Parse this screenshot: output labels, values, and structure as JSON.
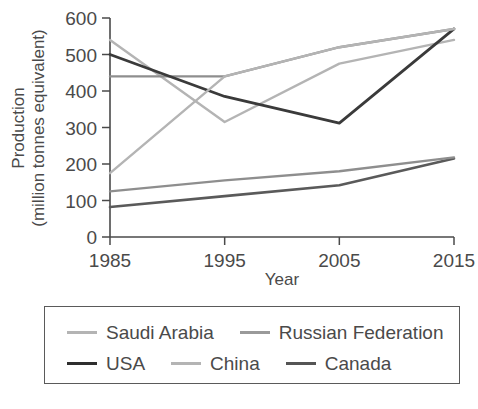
{
  "chart_data": {
    "type": "line",
    "title": "",
    "xlabel": "Year",
    "ylabel": "Production (million tonnes equivalent)",
    "ylabel_line1": "Production",
    "ylabel_line2": "(million tonnes equivalent)",
    "x": [
      1985,
      1995,
      2005,
      2015
    ],
    "categories": [
      "1985",
      "1995",
      "2005",
      "2015"
    ],
    "xticklabels": [
      "1985",
      "1995",
      "2005",
      "2015"
    ],
    "yticklabels": [
      "0",
      "100",
      "200",
      "300",
      "400",
      "500",
      "600"
    ],
    "yticks": [
      0,
      100,
      200,
      300,
      400,
      500,
      600
    ],
    "xlim": [
      1985,
      2015
    ],
    "ylim": [
      0,
      600
    ],
    "grid": false,
    "legend_position": "below-plot",
    "series": [
      {
        "name": "Saudi Arabia",
        "values": [
          540,
          315,
          475,
          540
        ],
        "color": "#b4b4b4",
        "width": 2.4
      },
      {
        "name": "Russian Federation",
        "values": [
          440,
          440,
          520,
          570
        ],
        "color": "#8e8e8e",
        "width": 2.4
      },
      {
        "name": "USA",
        "values": [
          500,
          385,
          312,
          570
        ],
        "color": "#3a3a3a",
        "width": 2.8
      },
      {
        "name": "China",
        "values": [
          175,
          440,
          520,
          570
        ],
        "color": "#b4b4b4",
        "width": 2.4
      },
      {
        "name": "Canada",
        "values": [
          82,
          112,
          142,
          215
        ],
        "color": "#5a5a5a",
        "width": 2.6
      }
    ],
    "lower_series": [
      {
        "name": "Russian Federation",
        "values": [
          125,
          155,
          180,
          218
        ],
        "color": "#8e8e8e",
        "width": 2.4
      }
    ]
  },
  "legend": {
    "rows": [
      [
        {
          "label": "Saudi Arabia",
          "color": "#b4b4b4",
          "width": "3px"
        },
        {
          "label": "Russian Federation",
          "color": "#9a9a9a",
          "width": "3px"
        }
      ],
      [
        {
          "label": "USA",
          "color": "#2e2e2e",
          "width": "3.5px"
        },
        {
          "label": "China",
          "color": "#b4b4b4",
          "width": "3px"
        },
        {
          "label": "Canada",
          "color": "#555555",
          "width": "3.5px"
        }
      ]
    ]
  },
  "colors": {
    "saudi_arabia": "#b4b4b4",
    "russian_federation": "#8e8e8e",
    "usa": "#3a3a3a",
    "china": "#b4b4b4",
    "canada": "#5a5a5a",
    "axis": "#4a4a4a",
    "background": "#ffffff",
    "legend_border": "#5a5a5a"
  }
}
